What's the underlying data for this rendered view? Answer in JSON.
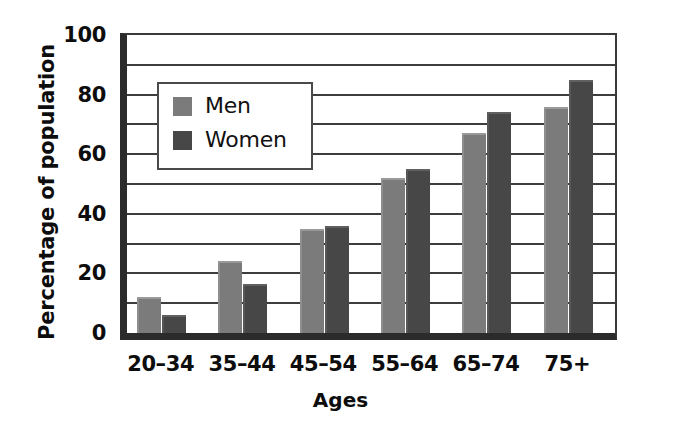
{
  "chart_data": {
    "type": "bar",
    "title": "",
    "subtitle": "",
    "xlabel": "Ages",
    "ylabel": "Percentage of population",
    "categories": [
      "20–34",
      "35–44",
      "45–54",
      "55–64",
      "65–74",
      "75+"
    ],
    "series": [
      {
        "name": "Men",
        "color": "#7b7b7b",
        "values": [
          12,
          24,
          35,
          52,
          67,
          76
        ]
      },
      {
        "name": "Women",
        "color": "#474747",
        "values": [
          6,
          16.5,
          36,
          55,
          74,
          85
        ]
      }
    ],
    "ylim": [
      0,
      100
    ],
    "y_ticks": [
      0,
      20,
      40,
      60,
      80,
      100
    ],
    "y_tick_labels": [
      "0",
      "20",
      "40",
      "60",
      "80",
      "100"
    ],
    "gridlines": [
      10,
      20,
      30,
      40,
      50,
      60,
      70,
      80,
      90
    ],
    "grid": true,
    "grid_interval": 10,
    "legend_position": "inside-upper-left",
    "legend_entries": [
      "Men",
      "Women"
    ],
    "bar_orientation": "vertical",
    "grouped": true
  },
  "axes": {
    "y_title": "Percentage of population",
    "x_title": "Ages"
  }
}
